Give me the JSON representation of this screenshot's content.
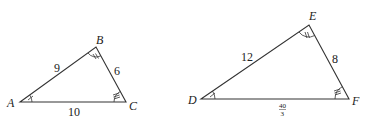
{
  "diagram": {
    "title": "",
    "triangles": [
      {
        "name": "ABC",
        "vertices": {
          "A": "A",
          "B": "B",
          "C": "C"
        },
        "sides": {
          "AB": "9",
          "BC": "6",
          "AC": "10"
        },
        "angle_marks": {
          "A": "single",
          "B": "double",
          "C": "triple"
        }
      },
      {
        "name": "DEF",
        "vertices": {
          "D": "D",
          "E": "E",
          "F": "F"
        },
        "sides": {
          "DE": "12",
          "EF": "8",
          "DF_num": "40",
          "DF_den": "3"
        },
        "angle_marks": {
          "D": "single",
          "E": "double",
          "F": "triple"
        }
      }
    ]
  }
}
